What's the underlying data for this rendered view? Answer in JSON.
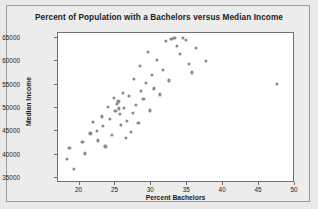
{
  "chart_data": {
    "type": "scatter",
    "title": "Percent of Population with a Bachelors versus Median Income",
    "xlabel": "Percent Bachelors",
    "ylabel": "Median Income",
    "xlim": [
      17,
      50
    ],
    "ylim": [
      34000,
      66000
    ],
    "xticks": [
      20,
      25,
      30,
      35,
      40,
      45,
      50
    ],
    "xtick_labels": [
      "20",
      "25",
      "30",
      "35",
      "40",
      "45",
      "50"
    ],
    "yticks": [
      35000,
      40000,
      45000,
      50000,
      55000,
      60000,
      65000
    ],
    "ytick_labels": [
      "35000",
      "40000",
      "45000",
      "50000",
      "55000",
      "60000",
      "65000"
    ],
    "grid": false,
    "legend": false,
    "marker_color": "#8a8a8a",
    "marker_size": 3.2,
    "series": [
      {
        "name": "States",
        "points": [
          [
            18.2,
            39200
          ],
          [
            18.6,
            41500
          ],
          [
            19.2,
            37000
          ],
          [
            20.4,
            42700
          ],
          [
            20.8,
            40300
          ],
          [
            21.5,
            44600
          ],
          [
            21.9,
            47000
          ],
          [
            22.4,
            45200
          ],
          [
            22.6,
            43100
          ],
          [
            23.1,
            48200
          ],
          [
            23.3,
            46100
          ],
          [
            23.6,
            41800
          ],
          [
            24.0,
            50200
          ],
          [
            24.2,
            47600
          ],
          [
            24.5,
            44200
          ],
          [
            24.8,
            52100
          ],
          [
            25.0,
            49300
          ],
          [
            25.2,
            50800
          ],
          [
            25.4,
            51400
          ],
          [
            25.5,
            49900
          ],
          [
            25.6,
            48700
          ],
          [
            25.8,
            46400
          ],
          [
            26.0,
            53300
          ],
          [
            26.2,
            50100
          ],
          [
            26.4,
            43600
          ],
          [
            26.6,
            47200
          ],
          [
            26.9,
            52600
          ],
          [
            27.1,
            44900
          ],
          [
            27.4,
            48900
          ],
          [
            27.6,
            56200
          ],
          [
            27.9,
            50600
          ],
          [
            28.2,
            46800
          ],
          [
            28.4,
            58900
          ],
          [
            28.6,
            53700
          ],
          [
            28.9,
            51900
          ],
          [
            29.2,
            55400
          ],
          [
            29.5,
            62000
          ],
          [
            29.8,
            49500
          ],
          [
            30.1,
            57100
          ],
          [
            30.4,
            54200
          ],
          [
            30.8,
            60300
          ],
          [
            31.2,
            52900
          ],
          [
            31.6,
            58200
          ],
          [
            32.0,
            64300
          ],
          [
            32.4,
            55900
          ],
          [
            32.8,
            64800
          ],
          [
            33.2,
            64900
          ],
          [
            33.6,
            63300
          ],
          [
            34.0,
            61600
          ],
          [
            34.4,
            65000
          ],
          [
            34.8,
            64600
          ],
          [
            35.2,
            59400
          ],
          [
            35.6,
            57600
          ],
          [
            36.2,
            62800
          ],
          [
            37.6,
            60100
          ],
          [
            47.5,
            55100
          ]
        ]
      }
    ]
  }
}
